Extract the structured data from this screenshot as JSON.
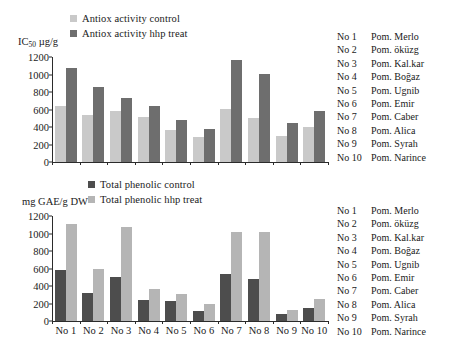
{
  "colors": {
    "light_gray": "#c9c9c9",
    "dark_gray": "#6e6e6e",
    "axis": "#2b2b2b",
    "text": "#1a1a1a"
  },
  "index_list": [
    {
      "no": "No 1",
      "name": "Pom. Merlo"
    },
    {
      "no": "No 2",
      "name": "Pom. öküzg"
    },
    {
      "no": "No 3",
      "name": "Pom. Kal.kar"
    },
    {
      "no": "No 4",
      "name": "Pom. Boğaz"
    },
    {
      "no": "No 5",
      "name": "Pom. Ugnib"
    },
    {
      "no": "No 6",
      "name": "Pom. Emir"
    },
    {
      "no": "No 7",
      "name": "Pom. Caber"
    },
    {
      "no": "No 8",
      "name": "Pom. Alica"
    },
    {
      "no": "No 9",
      "name": "Pom. Syrah"
    },
    {
      "no": "No 10",
      "name": "Pom. Narince"
    }
  ],
  "chart_data": [
    {
      "id": "antiox",
      "type": "bar",
      "title": "",
      "xlabel": "",
      "ylabel": "IC50 µg/g",
      "ylabel_main": "IC",
      "ylabel_sub": "50",
      "ylabel_rest": " µg/g",
      "ylim": [
        0,
        1200
      ],
      "yticks": [
        0,
        200,
        400,
        600,
        800,
        1000,
        1200
      ],
      "ytick_labels": [
        "0",
        "200",
        "400",
        "600",
        "800",
        "1000",
        "1200"
      ],
      "grid": false,
      "legend_position": "top-left",
      "categories": [
        "No 1",
        "No 2",
        "No 3",
        "No 4",
        "No 5",
        "No 6",
        "No 7",
        "No 8",
        "No 9",
        "No 10"
      ],
      "show_category_labels": false,
      "series": [
        {
          "name": "Antiox activity control",
          "color": "#c9c9c9",
          "values": [
            635,
            540,
            580,
            520,
            365,
            290,
            610,
            500,
            300,
            395
          ]
        },
        {
          "name": "Antiox activity hhp treat",
          "color": "#6e6e6e",
          "values": [
            1080,
            860,
            735,
            640,
            480,
            375,
            1170,
            1010,
            450,
            580
          ]
        }
      ]
    },
    {
      "id": "phenolic",
      "type": "bar",
      "title": "",
      "xlabel": "",
      "ylabel": "mg GAE/g DW",
      "ylim": [
        0,
        1200
      ],
      "yticks": [
        0,
        200,
        400,
        600,
        800,
        1000,
        1200
      ],
      "ytick_labels": [
        "0",
        "200",
        "400",
        "600",
        "800",
        "1000",
        "1200"
      ],
      "grid": false,
      "legend_position": "top-center",
      "categories": [
        "No 1",
        "No 2",
        "No 3",
        "No 4",
        "No 5",
        "No 6",
        "No 7",
        "No 8",
        "No 9",
        "No 10"
      ],
      "show_category_labels": true,
      "series": [
        {
          "name": "Total phenolic control",
          "color": "#4d4d4d",
          "values": [
            585,
            315,
            500,
            245,
            230,
            110,
            535,
            475,
            85,
            150
          ]
        },
        {
          "name": "Total phenolic hhp treat",
          "color": "#b5b5b5",
          "values": [
            1105,
            600,
            1075,
            365,
            305,
            200,
            1020,
            1020,
            130,
            255
          ]
        }
      ]
    }
  ]
}
